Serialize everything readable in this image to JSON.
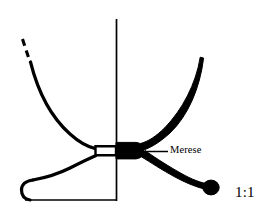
{
  "figure": {
    "kind": "archaeological-vessel-profile",
    "background_color": "#ffffff",
    "ink_color": "#000000",
    "width_px": 276,
    "height_px": 222
  },
  "annotations": {
    "merese": {
      "label": "Merese",
      "leader_line": true
    },
    "scale": {
      "label": "1:1"
    }
  },
  "drawing": {
    "axis": {
      "name": "centre-axis-line",
      "x": 116,
      "y_top": 19,
      "y_bottom": 201,
      "stroke_width": 1.6
    },
    "baseline": {
      "name": "foot-baseline",
      "x_left": 22,
      "x_right": 116,
      "y": 200,
      "stroke_width": 1.6
    },
    "left_profile_outline": {
      "description": "Outlined (unsectioned) left half: bowl wall, stem, splayed foot",
      "rim_top": {
        "x": 22,
        "y": 38
      },
      "dashed_break": {
        "y_start": 38,
        "y_end": 62
      }
    },
    "right_section_solid": {
      "description": "Solid black sectioned right half: bowl wall, merese knop, foot ending in rounded knob",
      "rim_top": {
        "x": 203,
        "y": 58
      },
      "foot_knob": {
        "cx": 212,
        "cy": 188,
        "r": 8
      }
    },
    "merese_block": {
      "hollow_box": {
        "x": 95,
        "y": 146,
        "width": 21,
        "height": 9
      },
      "solid_block": {
        "x": 116,
        "y": 142,
        "width": 27,
        "height": 17
      }
    }
  }
}
